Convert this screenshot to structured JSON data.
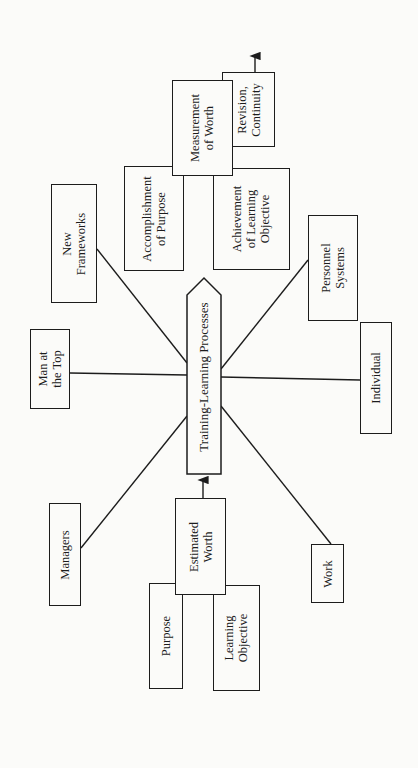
{
  "diagram": {
    "center": {
      "label": "Training-Learning Processes"
    },
    "spokes": [
      {
        "id": "new-frameworks",
        "lines": [
          "New",
          "Frameworks"
        ]
      },
      {
        "id": "man-at-the-top",
        "lines": [
          "Man at",
          "the Top"
        ]
      },
      {
        "id": "managers",
        "lines": [
          "Managers"
        ]
      },
      {
        "id": "work",
        "lines": [
          "Work"
        ]
      },
      {
        "id": "individual",
        "lines": [
          "Individual"
        ]
      },
      {
        "id": "personnel-systems",
        "lines": [
          "Personnel",
          "Systems"
        ]
      }
    ],
    "input_group": {
      "estimated_worth": {
        "lines": [
          "Estimated",
          "Worth"
        ]
      },
      "purpose": {
        "lines": [
          "Purpose"
        ]
      },
      "learning_objective": {
        "lines": [
          "Learning",
          "Objective"
        ]
      }
    },
    "output_group": {
      "measurement_of_worth": {
        "lines": [
          "Measurement",
          "of Worth"
        ]
      },
      "accomplishment_of_purpose": {
        "lines": [
          "Accomplishment",
          "of Purpose"
        ]
      },
      "achievement_of_learning_objective": {
        "lines": [
          "Achievement",
          "of Learning",
          "Objective"
        ]
      },
      "revision_continuity": {
        "lines": [
          "Revision,",
          "Continuity"
        ]
      }
    },
    "colors": {
      "ink": "#1c1c1c",
      "paper": "#fbfbf9"
    }
  }
}
